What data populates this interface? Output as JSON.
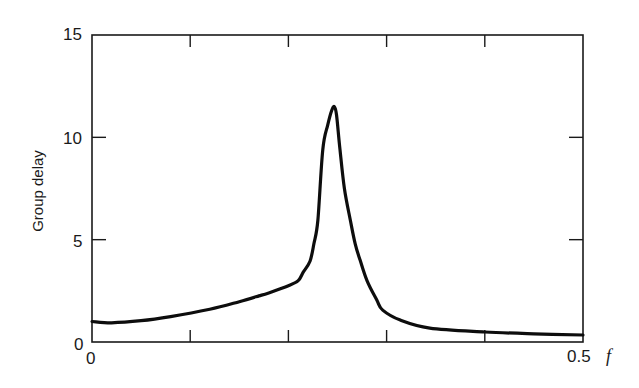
{
  "chart_data": {
    "type": "line",
    "title": "",
    "xlabel": "f",
    "ylabel": "Group delay",
    "xlim": [
      0,
      0.5
    ],
    "ylim": [
      0,
      15
    ],
    "grid": false,
    "legend": null,
    "x_tick_labels": [
      "0",
      "0.5"
    ],
    "x_ticks": [
      0,
      0.1,
      0.2,
      0.3,
      0.4,
      0.5
    ],
    "y_tick_labels": [
      "0",
      "5",
      "10",
      "15"
    ],
    "y_ticks": [
      0,
      5,
      10,
      15
    ],
    "series": [
      {
        "name": "Group delay",
        "x": [
          0,
          0.02,
          0.05,
          0.08,
          0.12,
          0.15,
          0.17,
          0.18,
          0.2,
          0.21,
          0.215,
          0.222,
          0.226,
          0.23,
          0.235,
          0.24,
          0.244,
          0.2467,
          0.249,
          0.2525,
          0.257,
          0.263,
          0.268,
          0.273,
          0.28,
          0.29,
          0.296,
          0.314,
          0.344,
          0.4,
          0.45,
          0.5
        ],
        "values": [
          1.0,
          0.94,
          1.04,
          1.24,
          1.6,
          1.97,
          2.25,
          2.4,
          2.75,
          3.0,
          3.4,
          3.95,
          4.8,
          5.96,
          9.4,
          10.6,
          11.3,
          11.5,
          11.1,
          9.4,
          7.5,
          5.96,
          4.8,
          4.0,
          3.0,
          2.05,
          1.56,
          1.07,
          0.68,
          0.49,
          0.4,
          0.34
        ]
      }
    ],
    "peak": {
      "f": 0.247,
      "value": 11.5
    }
  },
  "axes": {
    "y_title": "Group delay",
    "x_var": "f",
    "y_labels": {
      "y0": "0",
      "y5": "5",
      "y10": "10",
      "y15": "15"
    },
    "x_labels": {
      "x0": "0",
      "x05": "0.5"
    }
  },
  "colors": {
    "line": "#0d0d0d",
    "axis": "#1a1a1a",
    "background": "#ffffff"
  }
}
